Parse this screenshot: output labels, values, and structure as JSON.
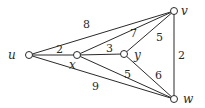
{
  "graph": {
    "nodes": [
      {
        "id": "u",
        "label": "u",
        "x": 29,
        "y": 55
      },
      {
        "id": "x",
        "label": "x",
        "x": 77,
        "y": 55
      },
      {
        "id": "y",
        "label": "y",
        "x": 124,
        "y": 54
      },
      {
        "id": "v",
        "label": "v",
        "x": 174,
        "y": 11
      },
      {
        "id": "w",
        "label": "w",
        "x": 174,
        "y": 99
      }
    ],
    "edges": [
      {
        "from": "u",
        "to": "v",
        "weight": "8"
      },
      {
        "from": "u",
        "to": "x",
        "weight": "2"
      },
      {
        "from": "u",
        "to": "w",
        "weight": "9"
      },
      {
        "from": "x",
        "to": "v",
        "weight": "7"
      },
      {
        "from": "x",
        "to": "y",
        "weight": "3"
      },
      {
        "from": "x",
        "to": "w",
        "weight": "5"
      },
      {
        "from": "y",
        "to": "v",
        "weight": "5"
      },
      {
        "from": "y",
        "to": "w",
        "weight": "6"
      },
      {
        "from": "v",
        "to": "w",
        "weight": "2"
      }
    ]
  }
}
